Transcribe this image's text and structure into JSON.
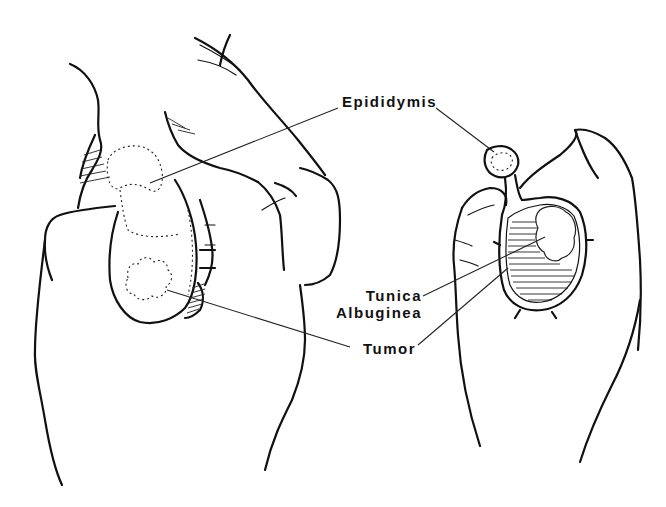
{
  "figure": {
    "type": "medical line illustration",
    "panels": [
      {
        "name": "left-panel",
        "description": "Hand palpating testis with epididymis and tumor (external view)"
      },
      {
        "name": "right-panel",
        "description": "Hand holding bisected testis showing tunica albuginea and tumor"
      }
    ],
    "labels": {
      "epididymis": "Epididymis",
      "tunica_line1": "Tunica",
      "tunica_line2": "Albuginea",
      "tumor": "Tumor"
    },
    "colors": {
      "ink": "#111111",
      "background": "#ffffff"
    }
  }
}
